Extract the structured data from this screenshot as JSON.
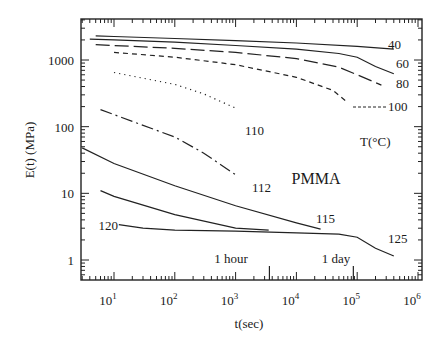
{
  "chart_data": {
    "type": "line",
    "title": "",
    "annotation_material": "PMMA",
    "legend_title": "T(°C)",
    "xlabel": "t(sec)",
    "ylabel": "E(t) (MPa)",
    "xscale": "log",
    "yscale": "log",
    "xlim": [
      3,
      1000000
    ],
    "ylim": [
      0.6,
      3000
    ],
    "x_ticks": [
      10,
      100,
      1000,
      10000,
      100000,
      1000000
    ],
    "x_tick_labels": [
      {
        "base": "10",
        "exp": "1"
      },
      {
        "base": "10",
        "exp": "2"
      },
      {
        "base": "10",
        "exp": "3"
      },
      {
        "base": "10",
        "exp": "4"
      },
      {
        "base": "10",
        "exp": "5"
      },
      {
        "base": "10",
        "exp": "6"
      }
    ],
    "y_ticks": [
      1,
      10,
      100,
      1000
    ],
    "y_tick_labels": [
      "1",
      "10",
      "100",
      "1000"
    ],
    "grid": false,
    "time_markers": [
      {
        "label": "1 hour",
        "x": 3600
      },
      {
        "label": "1 day",
        "x": 86400
      }
    ],
    "series": [
      {
        "name": "40",
        "style": "solid",
        "points": [
          [
            5,
            2300
          ],
          [
            10,
            2250
          ],
          [
            100,
            2100
          ],
          [
            1000,
            1950
          ],
          [
            10000,
            1800
          ],
          [
            100000,
            1600
          ],
          [
            400000,
            1450
          ]
        ]
      },
      {
        "name": "60",
        "style": "solid",
        "points": [
          [
            4,
            2050
          ],
          [
            10,
            2000
          ],
          [
            100,
            1850
          ],
          [
            1000,
            1650
          ],
          [
            10000,
            1450
          ],
          [
            50000,
            1250
          ],
          [
            100000,
            1100
          ],
          [
            200000,
            800
          ],
          [
            400000,
            620
          ]
        ]
      },
      {
        "name": "80",
        "style": "long-dash",
        "points": [
          [
            5,
            1700
          ],
          [
            10,
            1650
          ],
          [
            100,
            1500
          ],
          [
            1000,
            1300
          ],
          [
            10000,
            1050
          ],
          [
            50000,
            780
          ],
          [
            100000,
            600
          ],
          [
            250000,
            420
          ]
        ]
      },
      {
        "name": "100",
        "style": "short-dash",
        "points": [
          [
            10,
            1300
          ],
          [
            100,
            1100
          ],
          [
            1000,
            850
          ],
          [
            10000,
            550
          ],
          [
            40000,
            350
          ],
          [
            70000,
            230
          ]
        ]
      },
      {
        "name": "110",
        "style": "dotted",
        "points": [
          [
            10,
            650
          ],
          [
            100,
            430
          ],
          [
            300,
            310
          ],
          [
            1000,
            190
          ]
        ]
      },
      {
        "name": "112",
        "style": "dash-dot",
        "points": [
          [
            6,
            180
          ],
          [
            20,
            120
          ],
          [
            100,
            70
          ],
          [
            300,
            40
          ],
          [
            1000,
            19
          ]
        ]
      },
      {
        "name": "115",
        "style": "solid",
        "points": [
          [
            3,
            48
          ],
          [
            10,
            28
          ],
          [
            100,
            13
          ],
          [
            1000,
            6.5
          ],
          [
            10000,
            3.6
          ],
          [
            25000,
            2.9
          ]
        ]
      },
      {
        "name": "120",
        "style": "solid",
        "points": [
          [
            6,
            11
          ],
          [
            10,
            9
          ],
          [
            100,
            4.8
          ],
          [
            1000,
            3
          ],
          [
            3500,
            2.8
          ]
        ]
      },
      {
        "name": "125",
        "style": "solid",
        "points": [
          [
            12,
            3.4
          ],
          [
            30,
            3
          ],
          [
            100,
            2.8
          ],
          [
            1000,
            2.7
          ],
          [
            10000,
            2.55
          ],
          [
            50000,
            2.45
          ],
          [
            100000,
            2.2
          ],
          [
            200000,
            1.5
          ],
          [
            400000,
            1.15
          ]
        ]
      }
    ]
  }
}
